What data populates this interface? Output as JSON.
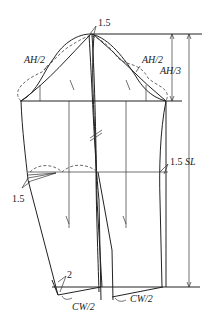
{
  "diagram": {
    "type": "two-piece sleeve pattern draft",
    "labels": {
      "top_ease": "1.5",
      "ah_half_left": "AH/2",
      "ah_half_right": "AH/2",
      "cap_height": "AH/3",
      "elbow_right": "1.5",
      "sleeve_length": "SL",
      "elbow_left": "1.5",
      "hem_offset": "2",
      "cuff_left": "CW/2",
      "cuff_right": "CW/2"
    }
  }
}
